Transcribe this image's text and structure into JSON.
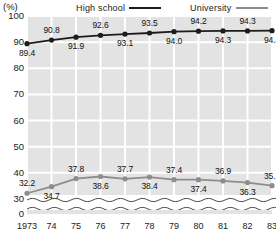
{
  "chart_data": {
    "type": "line",
    "title": "",
    "unit_label": "(%)",
    "xlabel": "",
    "ylabel": "",
    "grid": true,
    "legend_position": "top",
    "axis_break": true,
    "axis_break_between": [
      0,
      30
    ],
    "ylim": [
      0,
      100
    ],
    "yticks": [
      0,
      30,
      40,
      50,
      60,
      70,
      80,
      90,
      100
    ],
    "categories": [
      "1973",
      "74",
      "75",
      "76",
      "77",
      "78",
      "79",
      "80",
      "81",
      "82",
      "83"
    ],
    "x": [
      1973,
      1974,
      1975,
      1976,
      1977,
      1978,
      1979,
      1980,
      1981,
      1982,
      1983
    ],
    "series": [
      {
        "name": "High school",
        "color": "#1c1c1c",
        "values": [
          89.4,
          90.8,
          91.9,
          92.6,
          93.1,
          93.5,
          94.0,
          94.2,
          94.3,
          94.3,
          94.4
        ],
        "label_positions": [
          "below",
          "above",
          "below",
          "above",
          "below",
          "above",
          "below",
          "above",
          "below",
          "above",
          "below"
        ]
      },
      {
        "name": "University",
        "color": "#8d8d8d",
        "values": [
          32.2,
          34.7,
          37.8,
          38.6,
          37.7,
          38.4,
          37.4,
          37.4,
          36.9,
          36.3,
          35.1
        ],
        "label_positions": [
          "above",
          "below",
          "above",
          "below",
          "above",
          "below",
          "above",
          "below",
          "above",
          "below",
          "above"
        ]
      }
    ]
  },
  "legend": {
    "high_school": "High  school",
    "university": "University"
  },
  "colors": {
    "plot_background": "#e3e3e3",
    "gridline": "#ffffff",
    "high_school_line": "#1c1c1c",
    "university_line": "#8d8d8d",
    "text": "#1a1a1a"
  }
}
